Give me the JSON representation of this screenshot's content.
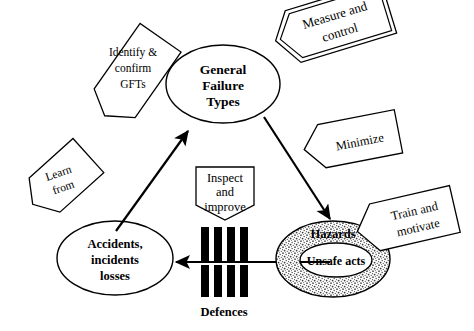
{
  "figure": {
    "background_color": "#ffffff",
    "line_color": "#000000"
  },
  "nodes": [
    {
      "id": "general-failure-types",
      "label_lines": [
        "General",
        "Failure",
        "Types"
      ],
      "shape": "ellipse",
      "cx": 223,
      "cy": 84,
      "rx": 57,
      "ry": 39,
      "fill": "#ffffff"
    },
    {
      "id": "accidents-incidents-losses",
      "label_lines": [
        "Accidents,",
        "incidents",
        "losses"
      ],
      "shape": "ellipse",
      "cx": 115,
      "cy": 258,
      "rx": 58,
      "ry": 37,
      "fill": "#ffffff"
    },
    {
      "id": "hazards",
      "label_lines": [
        "Hazards"
      ],
      "shape": "ellipse-stippled",
      "cx": 333,
      "cy": 259,
      "rx": 57,
      "ry": 38,
      "fill": "#c9c9c9"
    },
    {
      "id": "unsafe-acts",
      "label_lines": [
        "Unsafe acts"
      ],
      "shape": "ellipse",
      "cx": 336,
      "cy": 260,
      "rx": 36,
      "ry": 17,
      "fill": "#ffffff"
    }
  ],
  "tags": [
    {
      "id": "measure-and-control",
      "label_lines": [
        "Measure and",
        "control"
      ],
      "shape": "pentagon-arrow-left-double",
      "rotation": -18,
      "text_rotation": -17
    },
    {
      "id": "identify-confirm-gfts",
      "label_lines": [
        "Identify &",
        "confirm",
        "GFTs"
      ],
      "shape": "pentagon-arrow-rotated",
      "rotation": -55,
      "text_rotation": 62
    },
    {
      "id": "learn-from",
      "label_lines": [
        "Learn",
        "from"
      ],
      "shape": "pentagon-arrow-rotated",
      "rotation": -58,
      "text_rotation": 35
    },
    {
      "id": "inspect-and-improve",
      "label_lines": [
        "Inspect",
        "and",
        "improve"
      ],
      "shape": "pentagon-arrow-down",
      "rotation": 0,
      "text_rotation": 0
    },
    {
      "id": "minimize",
      "label_lines": [
        "Minimize"
      ],
      "shape": "pentagon-arrow-left",
      "rotation": -12,
      "text_rotation": -12
    },
    {
      "id": "train-and-motivate",
      "label_lines": [
        "Train and",
        "motivate"
      ],
      "shape": "pentagon-arrow-left",
      "rotation": -14,
      "text_rotation": -14
    }
  ],
  "defences": {
    "label": "Defences",
    "bar_count_top": 4,
    "bar_count_bottom": 4,
    "bar_color": "#000000"
  },
  "arrows": [
    {
      "id": "accidents-to-gft",
      "from": "accidents-incidents-losses",
      "to": "general-failure-types",
      "direction": "up-right"
    },
    {
      "id": "gft-to-hazards",
      "from": "general-failure-types",
      "to": "hazards",
      "direction": "down-right"
    },
    {
      "id": "hazards-to-accidents",
      "from": "hazards",
      "to": "accidents-incidents-losses",
      "direction": "left"
    }
  ],
  "text": {
    "general_failure_types_l1": "General",
    "general_failure_types_l2": "Failure",
    "general_failure_types_l3": "Types",
    "accidents_l1": "Accidents,",
    "accidents_l2": "incidents",
    "accidents_l3": "losses",
    "hazards": "Hazards",
    "unsafe_acts": "Unsafe acts",
    "measure_l1": "Measure and",
    "measure_l2": "control",
    "identify_l1": "Identify &",
    "identify_l2": "confirm",
    "identify_l3": "GFTs",
    "learn_l1": "Learn",
    "learn_l2": "from",
    "inspect_l1": "Inspect",
    "inspect_l2": "and",
    "inspect_l3": "improve",
    "minimize": "Minimize",
    "train_l1": "Train and",
    "train_l2": "motivate",
    "defences": "Defences"
  }
}
